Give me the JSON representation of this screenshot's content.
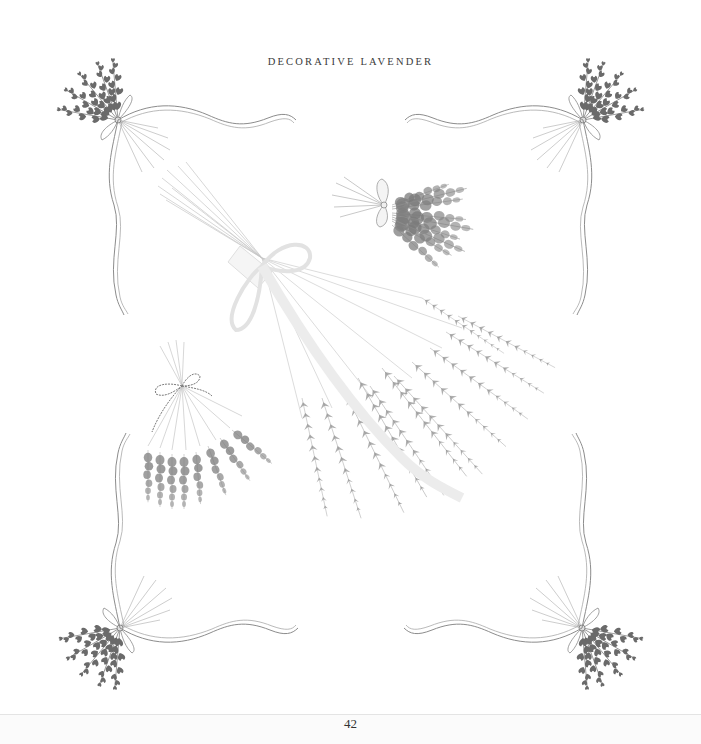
{
  "page": {
    "running_head": "DECORATIVE LAVENDER",
    "page_number": "42"
  },
  "illustration": {
    "subject": "lavender bundles and corner sprigs with ribbons",
    "elements": [
      {
        "name": "corner-sprig-top-left",
        "type": "lavender sprig with ribbon"
      },
      {
        "name": "corner-sprig-top-right",
        "type": "lavender sprig with ribbon"
      },
      {
        "name": "corner-sprig-bottom-left",
        "type": "lavender sprig with ribbon"
      },
      {
        "name": "corner-sprig-bottom-right",
        "type": "lavender sprig with ribbon"
      },
      {
        "name": "small-bundle-bow",
        "type": "lavender bunch tied with bow"
      },
      {
        "name": "small-bundle-twine",
        "type": "lavender bunch tied with twine"
      },
      {
        "name": "large-bundle",
        "type": "large lavender bouquet tied with ribbon"
      }
    ],
    "colors": {
      "ink": "#555555",
      "flower": "#6e6e6e",
      "stem": "#9a9a9a",
      "ribbon": "#b0b0b0"
    }
  }
}
